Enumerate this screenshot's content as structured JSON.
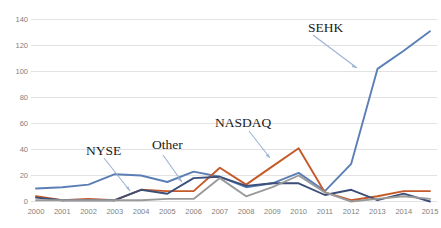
{
  "chart_data": {
    "type": "line",
    "title": "",
    "xlabel": "",
    "ylabel": "",
    "categories": [
      "2000",
      "2001",
      "2002",
      "2003",
      "2004",
      "2005",
      "2006",
      "2007",
      "2008",
      "2009",
      "2010",
      "2011",
      "2012",
      "2013",
      "2014",
      "2015"
    ],
    "ylim": [
      0,
      145
    ],
    "yticks": [
      0,
      20,
      40,
      60,
      80,
      100,
      120,
      140
    ],
    "ytick_labels": [
      "0",
      "20",
      "40",
      "60",
      "80",
      "100",
      "120",
      "140"
    ],
    "grid": true,
    "grid_axis": "y",
    "legend": "none",
    "annotations": [
      {
        "label": "NYSE",
        "points_to_series": "NYSE",
        "points_to_year": "2004"
      },
      {
        "label": "Other",
        "points_to_series": "Other",
        "points_to_year": "2006"
      },
      {
        "label": "NASDAQ",
        "points_to_series": "NASDAQ",
        "points_to_year": "2009"
      },
      {
        "label": "SEHK",
        "points_to_series": "SEHK",
        "points_to_year": "2013"
      }
    ],
    "series": [
      {
        "name": "SEHK",
        "color": "#5b7fb5",
        "values": [
          10,
          11,
          13,
          21,
          20,
          15,
          23,
          19,
          11,
          14,
          22,
          8,
          29,
          102,
          116,
          131
        ]
      },
      {
        "name": "NASDAQ",
        "color": "#c55a29",
        "values": [
          4,
          1,
          2,
          1,
          9,
          8,
          8,
          26,
          13,
          27,
          41,
          7,
          1,
          4,
          8,
          8
        ]
      },
      {
        "name": "NYSE",
        "color": "#3b4f79",
        "values": [
          3,
          1,
          1,
          1,
          9,
          6,
          18,
          19,
          12,
          14,
          14,
          5,
          9,
          1,
          6,
          0
        ]
      },
      {
        "name": "Other",
        "color": "#9a9a9a",
        "values": [
          1,
          1,
          1,
          1,
          1,
          2,
          2,
          18,
          4,
          11,
          20,
          7,
          0,
          2,
          4,
          2
        ]
      }
    ]
  },
  "axis": {
    "y_ticks": [
      "0",
      "20",
      "40",
      "60",
      "80",
      "100",
      "120",
      "140"
    ],
    "x_ticks": [
      "2000",
      "2001",
      "2002",
      "2003",
      "2004",
      "2005",
      "2006",
      "2007",
      "2008",
      "2009",
      "2010",
      "2011",
      "2012",
      "2013",
      "2014",
      "2015"
    ]
  },
  "annotations": {
    "nyse": "NYSE",
    "other": "Other",
    "nasdaq": "NASDAQ",
    "sehk": "SEHK"
  },
  "colors": {
    "sehk": "#5b7fb5",
    "nasdaq": "#c55a29",
    "nyse": "#3b4f79",
    "other": "#9a9a9a",
    "grid": "#e2e2e2",
    "tick_text": "#7f7f7f",
    "annotation_text": "#1a1a1a",
    "arrow": "#9bb3d4"
  }
}
